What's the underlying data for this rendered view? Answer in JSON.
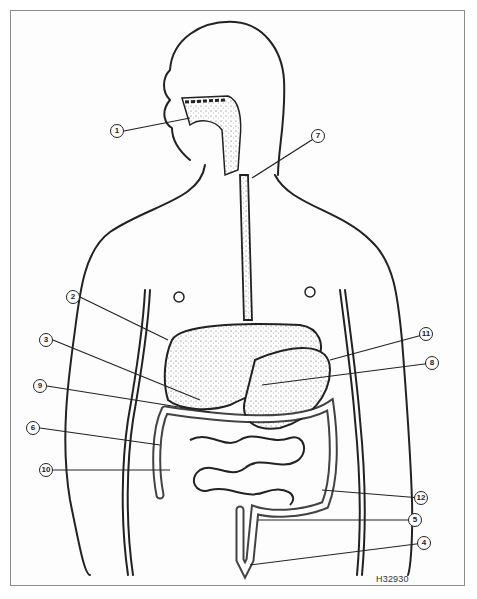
{
  "figure": {
    "id_label": "H32930",
    "colors": {
      "line": "#222222",
      "stipple": "#555555",
      "frame": "#8a8a8a",
      "background": "#ffffff"
    }
  },
  "callouts": [
    {
      "number": "1",
      "x": 117,
      "y": 131
    },
    {
      "number": "7",
      "x": 318,
      "y": 136
    },
    {
      "number": "2",
      "x": 73,
      "y": 297
    },
    {
      "number": "3",
      "x": 46,
      "y": 340
    },
    {
      "number": "9",
      "x": 40,
      "y": 386
    },
    {
      "number": "6",
      "x": 33,
      "y": 428
    },
    {
      "number": "10",
      "x": 46,
      "y": 470
    },
    {
      "number": "11",
      "x": 426,
      "y": 334
    },
    {
      "number": "8",
      "x": 432,
      "y": 363
    },
    {
      "number": "12",
      "x": 421,
      "y": 498
    },
    {
      "number": "5",
      "x": 415,
      "y": 520
    },
    {
      "number": "4",
      "x": 424,
      "y": 543
    }
  ]
}
